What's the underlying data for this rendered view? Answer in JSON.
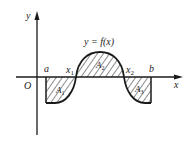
{
  "diagram": {
    "axes": {
      "x_label": "x",
      "y_label": "y",
      "origin_label": "O"
    },
    "curve_label": "y = f(x)",
    "points": {
      "a": "a",
      "x1": "x",
      "x1_sub": "1",
      "x2": "x",
      "x2_sub": "2",
      "b": "b"
    },
    "regions": [
      {
        "name": "A",
        "sub": "1",
        "position": "below axis, between a and x1"
      },
      {
        "name": "A",
        "sub": "2",
        "position": "above axis, between x1 and x2"
      },
      {
        "name": "A",
        "sub": "3",
        "position": "below axis, between x2 and b"
      }
    ],
    "colors": {
      "stroke": "#1a1a1a",
      "background": "#ffffff"
    }
  }
}
